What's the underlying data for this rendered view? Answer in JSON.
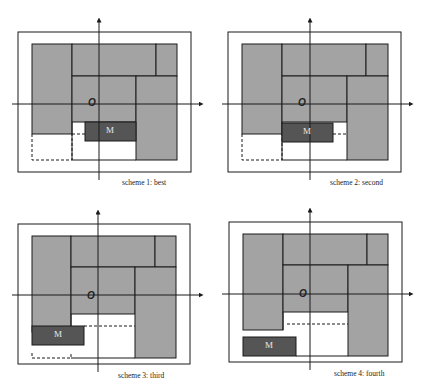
{
  "diagram": {
    "colors": {
      "background": "#ffffff",
      "block_fill": "#a3a3a3",
      "module_fill": "#555555",
      "line": "#1a1a1a",
      "module_text": "#e8e8e8"
    },
    "origin_label": "O",
    "module_label": "M",
    "panels": [
      {
        "id": 1,
        "caption": "scheme 1: best"
      },
      {
        "id": 2,
        "caption": "scheme 2: second"
      },
      {
        "id": 3,
        "caption": "scheme 3: third"
      },
      {
        "id": 4,
        "caption": "scheme 4: fourth"
      }
    ]
  }
}
